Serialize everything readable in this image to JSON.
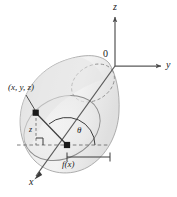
{
  "figure": {
    "background": "#ffffff",
    "solid_fill": "#ebebeb",
    "solid_fill_light": "#f4f4f4",
    "stroke": "#8a8a8a",
    "axis_color": "#555555",
    "text_color": "#1a1a1a",
    "labels": {
      "z_axis": "z",
      "y_axis": "y",
      "x_axis": "x",
      "origin": "0",
      "point": "(x, y, z)",
      "height": "z",
      "theta": "θ",
      "radius": "f(x)"
    },
    "markers": {
      "point_on_surface": "square-dot",
      "center_point": "square-dot",
      "right_angle": "right-angle-marker",
      "radius_measure": "dimension-bracket"
    },
    "axes": {
      "z_direction": "up",
      "y_direction": "right",
      "x_direction": "down-left",
      "arrowheads": true
    }
  }
}
